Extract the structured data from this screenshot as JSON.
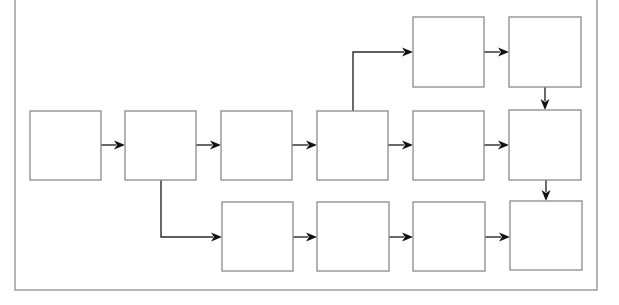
{
  "diagram": {
    "type": "flowchart",
    "canvas": {
      "width": 619,
      "height": 305
    },
    "colors": {
      "background": "#ffffff",
      "frame_stroke": "#8c8c8c",
      "node_stroke": "#8a8a8a",
      "edge_stroke": "#2a2a2a",
      "arrowhead": "#111111"
    },
    "frame": {
      "x": 15,
      "y": -10,
      "width": 582,
      "height": 300
    },
    "nodes": [
      {
        "id": "M1",
        "label": "",
        "row": "middle",
        "x": 30,
        "y": 111,
        "w": 71,
        "h": 69
      },
      {
        "id": "M2",
        "label": "",
        "row": "middle",
        "x": 125,
        "y": 111,
        "w": 71,
        "h": 69
      },
      {
        "id": "M3",
        "label": "",
        "row": "middle",
        "x": 221,
        "y": 111,
        "w": 71,
        "h": 69
      },
      {
        "id": "M4",
        "label": "",
        "row": "middle",
        "x": 317,
        "y": 111,
        "w": 71,
        "h": 69
      },
      {
        "id": "M5",
        "label": "",
        "row": "middle",
        "x": 413,
        "y": 111,
        "w": 71,
        "h": 69
      },
      {
        "id": "M6",
        "label": "",
        "row": "middle",
        "x": 509,
        "y": 110,
        "w": 72,
        "h": 70
      },
      {
        "id": "T1",
        "label": "",
        "row": "top",
        "x": 413,
        "y": 17,
        "w": 71,
        "h": 70
      },
      {
        "id": "T2",
        "label": "",
        "row": "top",
        "x": 509,
        "y": 17,
        "w": 72,
        "h": 70
      },
      {
        "id": "B1",
        "label": "",
        "row": "bottom",
        "x": 222,
        "y": 202,
        "w": 71,
        "h": 69
      },
      {
        "id": "B2",
        "label": "",
        "row": "bottom",
        "x": 317,
        "y": 202,
        "w": 72,
        "h": 69
      },
      {
        "id": "B3",
        "label": "",
        "row": "bottom",
        "x": 413,
        "y": 202,
        "w": 72,
        "h": 69
      },
      {
        "id": "B4",
        "label": "",
        "row": "bottom",
        "x": 510,
        "y": 201,
        "w": 72,
        "h": 69
      }
    ],
    "edges": [
      {
        "from": "M1",
        "to": "M2",
        "points": [
          [
            101,
            145
          ],
          [
            125,
            145
          ]
        ],
        "direction": "right"
      },
      {
        "from": "M2",
        "to": "M3",
        "points": [
          [
            196,
            145
          ],
          [
            221,
            145
          ]
        ],
        "direction": "right"
      },
      {
        "from": "M3",
        "to": "M4",
        "points": [
          [
            292,
            145
          ],
          [
            317,
            145
          ]
        ],
        "direction": "right"
      },
      {
        "from": "M4",
        "to": "M5",
        "points": [
          [
            388,
            145
          ],
          [
            413,
            145
          ]
        ],
        "direction": "right"
      },
      {
        "from": "M5",
        "to": "M6",
        "points": [
          [
            484,
            145
          ],
          [
            509,
            145
          ]
        ],
        "direction": "right"
      },
      {
        "from": "M4",
        "to": "T1",
        "points": [
          [
            353,
            111
          ],
          [
            353,
            52
          ],
          [
            413,
            52
          ]
        ],
        "direction": "right"
      },
      {
        "from": "T1",
        "to": "T2",
        "points": [
          [
            484,
            52
          ],
          [
            509,
            52
          ]
        ],
        "direction": "right"
      },
      {
        "from": "T2",
        "to": "M6",
        "points": [
          [
            545,
            87
          ],
          [
            545,
            110
          ]
        ],
        "direction": "down"
      },
      {
        "from": "M6",
        "to": "B4",
        "points": [
          [
            546,
            180
          ],
          [
            546,
            201
          ]
        ],
        "direction": "down"
      },
      {
        "from": "M2",
        "to": "B1",
        "points": [
          [
            161,
            180
          ],
          [
            161,
            237
          ],
          [
            222,
            237
          ]
        ],
        "direction": "right"
      },
      {
        "from": "B1",
        "to": "B2",
        "points": [
          [
            293,
            237
          ],
          [
            317,
            237
          ]
        ],
        "direction": "right"
      },
      {
        "from": "B2",
        "to": "B3",
        "points": [
          [
            389,
            237
          ],
          [
            413,
            237
          ]
        ],
        "direction": "right"
      },
      {
        "from": "B3",
        "to": "B4",
        "points": [
          [
            485,
            237
          ],
          [
            510,
            237
          ]
        ],
        "direction": "right"
      }
    ]
  }
}
